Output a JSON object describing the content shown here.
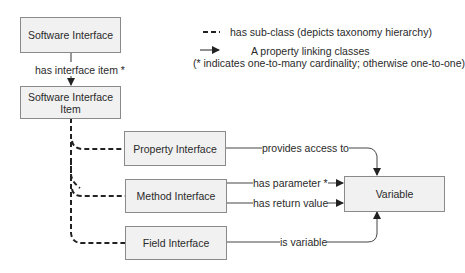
{
  "diagram": {
    "nodes": {
      "software_interface": "Software Interface",
      "software_interface_item": "Software Interface\nItem",
      "property_interface": "Property Interface",
      "method_interface": "Method Interface",
      "field_interface": "Field Interface",
      "variable": "Variable"
    },
    "edges": {
      "has_interface_item": "has interface item *",
      "provides_access_to": "provides access to",
      "has_parameter": "has parameter *",
      "has_return_value": "has return value",
      "is_variable": "is variable"
    },
    "legend": {
      "subclass": "has sub-class (depicts taxonomy hierarchy)",
      "property_line1": "A property linking classes",
      "property_line2": "(* indicates one-to-many cardinality; otherwise one-to-one)"
    },
    "colors": {
      "box_fill": "#f1f1f1",
      "box_border": "#8a8a8a",
      "line": "#333333"
    }
  }
}
